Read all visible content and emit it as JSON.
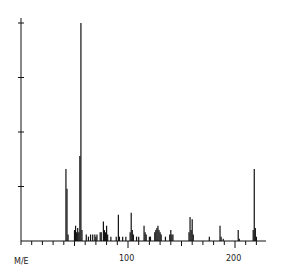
{
  "chart_data": {
    "type": "bar",
    "subtype": "mass-spectrum-stick",
    "title": "",
    "xlabel": "M/E",
    "ylabel": "",
    "xlim": [
      0,
      229
    ],
    "ylim": [
      0,
      100
    ],
    "x_tick_labels": [
      {
        "value": 100,
        "label": "100"
      },
      {
        "value": 200,
        "label": "200"
      }
    ],
    "x_minor_tick_step": 10,
    "y_ticks": [
      25,
      50,
      75,
      100
    ],
    "grid": false,
    "legend": null,
    "peaks": [
      {
        "mz": 42,
        "intensity": 33
      },
      {
        "mz": 43,
        "intensity": 24
      },
      {
        "mz": 44,
        "intensity": 3
      },
      {
        "mz": 50,
        "intensity": 5
      },
      {
        "mz": 51,
        "intensity": 7
      },
      {
        "mz": 52,
        "intensity": 4
      },
      {
        "mz": 53,
        "intensity": 6
      },
      {
        "mz": 54,
        "intensity": 4
      },
      {
        "mz": 55,
        "intensity": 39
      },
      {
        "mz": 56,
        "intensity": 100
      },
      {
        "mz": 57,
        "intensity": 5
      },
      {
        "mz": 61,
        "intensity": 3
      },
      {
        "mz": 63,
        "intensity": 2
      },
      {
        "mz": 65,
        "intensity": 3
      },
      {
        "mz": 67,
        "intensity": 3
      },
      {
        "mz": 69,
        "intensity": 3
      },
      {
        "mz": 70,
        "intensity": 2
      },
      {
        "mz": 71,
        "intensity": 3
      },
      {
        "mz": 74,
        "intensity": 4
      },
      {
        "mz": 75,
        "intensity": 4
      },
      {
        "mz": 77,
        "intensity": 9
      },
      {
        "mz": 78,
        "intensity": 5
      },
      {
        "mz": 79,
        "intensity": 4
      },
      {
        "mz": 80,
        "intensity": 7
      },
      {
        "mz": 81,
        "intensity": 3
      },
      {
        "mz": 84,
        "intensity": 2
      },
      {
        "mz": 89,
        "intensity": 2
      },
      {
        "mz": 91,
        "intensity": 12
      },
      {
        "mz": 92,
        "intensity": 2
      },
      {
        "mz": 95,
        "intensity": 2
      },
      {
        "mz": 98,
        "intensity": 2
      },
      {
        "mz": 102,
        "intensity": 4
      },
      {
        "mz": 103,
        "intensity": 13
      },
      {
        "mz": 104,
        "intensity": 5
      },
      {
        "mz": 105,
        "intensity": 3
      },
      {
        "mz": 108,
        "intensity": 2
      },
      {
        "mz": 110,
        "intensity": 2
      },
      {
        "mz": 115,
        "intensity": 7
      },
      {
        "mz": 116,
        "intensity": 4
      },
      {
        "mz": 117,
        "intensity": 3
      },
      {
        "mz": 120,
        "intensity": 2
      },
      {
        "mz": 121,
        "intensity": 2
      },
      {
        "mz": 125,
        "intensity": 4
      },
      {
        "mz": 126,
        "intensity": 5
      },
      {
        "mz": 127,
        "intensity": 6
      },
      {
        "mz": 128,
        "intensity": 7
      },
      {
        "mz": 129,
        "intensity": 5
      },
      {
        "mz": 130,
        "intensity": 4
      },
      {
        "mz": 131,
        "intensity": 3
      },
      {
        "mz": 135,
        "intensity": 2
      },
      {
        "mz": 139,
        "intensity": 3
      },
      {
        "mz": 140,
        "intensity": 5
      },
      {
        "mz": 141,
        "intensity": 3
      },
      {
        "mz": 142,
        "intensity": 3
      },
      {
        "mz": 157,
        "intensity": 4
      },
      {
        "mz": 158,
        "intensity": 11
      },
      {
        "mz": 159,
        "intensity": 5
      },
      {
        "mz": 160,
        "intensity": 10
      },
      {
        "mz": 161,
        "intensity": 3
      },
      {
        "mz": 176,
        "intensity": 2
      },
      {
        "mz": 186,
        "intensity": 7
      },
      {
        "mz": 187,
        "intensity": 2
      },
      {
        "mz": 189,
        "intensity": 1
      },
      {
        "mz": 203,
        "intensity": 5
      },
      {
        "mz": 204,
        "intensity": 1
      },
      {
        "mz": 217,
        "intensity": 5
      },
      {
        "mz": 218,
        "intensity": 33
      },
      {
        "mz": 219,
        "intensity": 6
      },
      {
        "mz": 220,
        "intensity": 2
      }
    ]
  },
  "labels": {
    "x_axis_name": "M/E",
    "tick_100": "100",
    "tick_200": "200"
  }
}
